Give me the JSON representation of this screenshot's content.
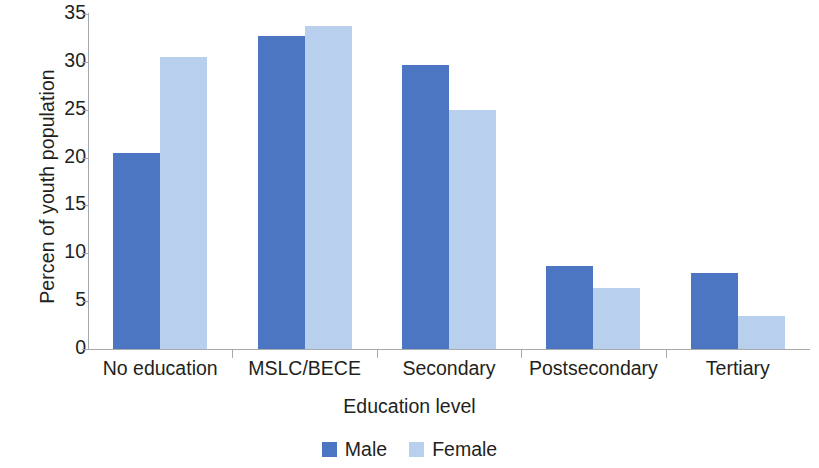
{
  "chart_data": {
    "type": "bar",
    "title": "",
    "xlabel": "Education level",
    "ylabel": "Percen of youth population",
    "categories": [
      "No education",
      "MSLC/BECE",
      "Secondary",
      "Postsecondary",
      "Tertiary"
    ],
    "series": [
      {
        "name": "Male",
        "color": "#4d76c2",
        "values": [
          20.5,
          32.7,
          29.7,
          8.7,
          7.9
        ]
      },
      {
        "name": "Female",
        "color": "#b9cfee",
        "values": [
          30.5,
          33.8,
          25.0,
          6.4,
          3.4
        ]
      }
    ],
    "ylim": [
      0,
      35
    ],
    "yticks": [
      0,
      5,
      10,
      15,
      20,
      25,
      30,
      35
    ],
    "ytick_labels": [
      "0",
      "5",
      "10",
      "15",
      "20",
      "25",
      "30",
      "35"
    ],
    "grid": false,
    "legend_position": "bottom"
  },
  "legend": {
    "items": [
      {
        "label": "Male",
        "color": "#4d76c2"
      },
      {
        "label": "Female",
        "color": "#b9cfee"
      }
    ]
  },
  "axis": {
    "line_color": "#a7a9ac"
  }
}
